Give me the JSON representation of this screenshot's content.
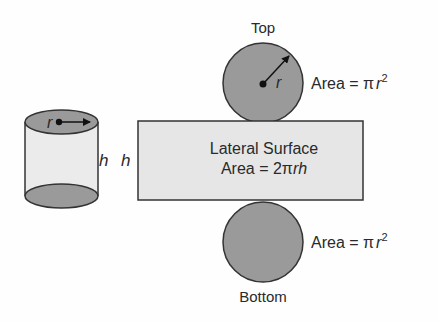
{
  "diagram": {
    "cylinder": {
      "radius_label": "r",
      "height_label": "h"
    },
    "net": {
      "height_label": "h",
      "top": {
        "label": "Top",
        "radius_label": "r",
        "area_prefix": "Area = ",
        "area_pi": "π",
        "area_var": "r",
        "area_exp": "2"
      },
      "lateral": {
        "line1": "Lateral Surface",
        "line2_prefix": "Area = 2",
        "line2_pi": "π",
        "line2_var": "rh"
      },
      "bottom": {
        "label": "Bottom",
        "area_prefix": "Area = ",
        "area_pi": "π",
        "area_var": "r",
        "area_exp": "2"
      }
    },
    "colors": {
      "disc_fill": "#9a9a9a",
      "lateral_fill": "#e6e6e6",
      "outline": "#333333",
      "text": "#2a2a2a"
    }
  }
}
